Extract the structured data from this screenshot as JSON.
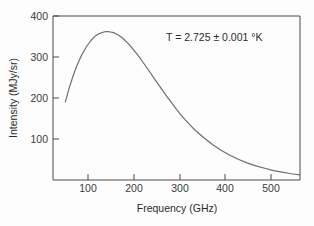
{
  "chart_data": {
    "type": "line",
    "title": "",
    "xlabel": "Frequency (GHz)",
    "ylabel": "Intensity (MJy/sr)",
    "xlim": [
      40,
      600
    ],
    "ylim": [
      0,
      420
    ],
    "xticks": [
      100,
      200,
      300,
      400,
      500
    ],
    "xtick_labels": [
      "100",
      "200",
      "300",
      "400",
      "500"
    ],
    "yticks": [
      100,
      200,
      300,
      400
    ],
    "ytick_labels": [
      "100",
      "200",
      "300",
      "400"
    ],
    "grid": false,
    "legend": null,
    "annotations": [
      {
        "text": "T = 2.725 ± 0.001 °K",
        "x": 300,
        "y": 355
      }
    ],
    "series": [
      {
        "name": "CMB blackbody spectrum",
        "color": "#6e6e6e",
        "x": [
          68,
          75,
          85,
          95,
          105,
          115,
          125,
          135,
          145,
          155,
          160,
          165,
          170,
          175,
          180,
          190,
          200,
          210,
          220,
          230,
          240,
          250,
          260,
          270,
          280,
          290,
          300,
          310,
          320,
          330,
          340,
          350,
          360,
          380,
          400,
          420,
          440,
          460,
          480,
          500,
          520,
          540,
          560,
          580,
          600
        ],
        "y": [
          200,
          229,
          265,
          295,
          320,
          340,
          356,
          368,
          375,
          379,
          380,
          380,
          379,
          378,
          376,
          370,
          361,
          350,
          337,
          323,
          308,
          292,
          276,
          259,
          243,
          227,
          211,
          196,
          181,
          167,
          154,
          142,
          130,
          110,
          92,
          77,
          64,
          53,
          44,
          36,
          30,
          24,
          20,
          16,
          13
        ]
      }
    ]
  }
}
